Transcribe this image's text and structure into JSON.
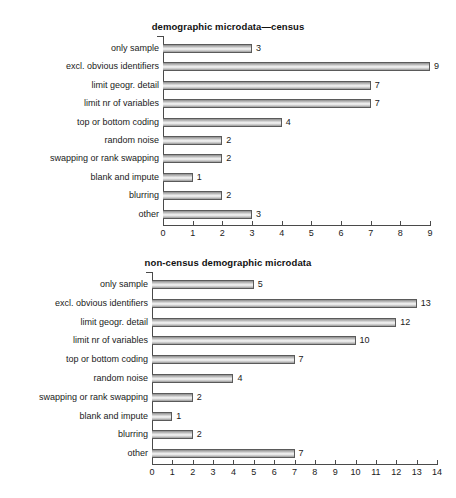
{
  "figure": {
    "background": "#ffffff",
    "bar_fill_light": "#f2f2f2",
    "bar_fill_dark": "#8f8f8f",
    "axis_color": "#4a4a4a",
    "text_color": "#1a1a1a"
  },
  "chart_data": [
    {
      "type": "bar",
      "orientation": "horizontal",
      "title": "demographic microdata—census",
      "xlabel": "",
      "ylabel": "",
      "xlim": [
        0,
        9
      ],
      "ticks": [
        0,
        1,
        2,
        3,
        4,
        5,
        6,
        7,
        8,
        9
      ],
      "grid": false,
      "legend": "none",
      "categories": [
        "only sample",
        "excl. obvious identifiers",
        "limit geogr. detail",
        "limit nr of variables",
        "top or bottom coding",
        "random noise",
        "swapping or rank swapping",
        "blank and impute",
        "blurring",
        "other"
      ],
      "values": [
        3,
        9,
        7,
        7,
        4,
        2,
        2,
        1,
        2,
        3
      ],
      "value_labels": [
        "3",
        "9",
        "7",
        "7",
        "4",
        "2",
        "2",
        "1",
        "2",
        "3"
      ]
    },
    {
      "type": "bar",
      "orientation": "horizontal",
      "title": "non-census demographic microdata",
      "xlabel": "",
      "ylabel": "",
      "xlim": [
        0,
        14
      ],
      "ticks": [
        0,
        1,
        2,
        3,
        4,
        5,
        6,
        7,
        8,
        9,
        10,
        11,
        12,
        13,
        14
      ],
      "grid": false,
      "legend": "none",
      "categories": [
        "only sample",
        "excl. obvious identifiers",
        "limit geogr. detail",
        "limit nr of variables",
        "top or bottom coding",
        "random noise",
        "swapping or rank swapping",
        "blank and impute",
        "blurring",
        "other"
      ],
      "values": [
        5,
        13,
        12,
        10,
        7,
        4,
        2,
        1,
        2,
        7
      ],
      "value_labels": [
        "5",
        "13",
        "12",
        "10",
        "7",
        "4",
        "2",
        "1",
        "2",
        "7"
      ]
    }
  ]
}
